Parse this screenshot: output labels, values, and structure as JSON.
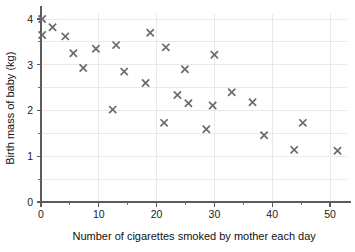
{
  "chart_data": {
    "type": "scatter",
    "title": "",
    "xlabel": "Number of cigarettes smoked by mother each day",
    "ylabel": "Birth mass of baby (kg)",
    "xlim": [
      0,
      53
    ],
    "ylim": [
      0,
      4.1
    ],
    "grid": true,
    "legend": null,
    "marker": "x",
    "marker_color": "#6a6a70",
    "x_ticks": [
      0,
      10,
      20,
      30,
      40,
      50
    ],
    "x_tick_labels": [
      "0",
      "10",
      "20",
      "30",
      "40",
      "50"
    ],
    "x_minor_ticks": [
      5,
      15,
      25,
      35,
      45
    ],
    "y_ticks": [
      0,
      1,
      2,
      3,
      4
    ],
    "y_tick_labels": [
      "0",
      "1",
      "2",
      "3",
      "4"
    ],
    "y_minor_ticks": [
      0.5,
      1.5,
      2.5,
      3.5
    ],
    "points": [
      {
        "x": 0.2,
        "y": 4.0
      },
      {
        "x": 0.2,
        "y": 3.65
      },
      {
        "x": 2.0,
        "y": 3.82
      },
      {
        "x": 4.2,
        "y": 3.62
      },
      {
        "x": 5.6,
        "y": 3.25
      },
      {
        "x": 7.3,
        "y": 2.93
      },
      {
        "x": 9.5,
        "y": 3.35
      },
      {
        "x": 12.4,
        "y": 2.02
      },
      {
        "x": 13.0,
        "y": 3.43
      },
      {
        "x": 14.4,
        "y": 2.85
      },
      {
        "x": 18.1,
        "y": 2.6
      },
      {
        "x": 18.9,
        "y": 3.7
      },
      {
        "x": 21.3,
        "y": 1.73
      },
      {
        "x": 21.6,
        "y": 3.38
      },
      {
        "x": 23.6,
        "y": 2.34
      },
      {
        "x": 24.9,
        "y": 2.9
      },
      {
        "x": 25.5,
        "y": 2.16
      },
      {
        "x": 28.6,
        "y": 1.59
      },
      {
        "x": 29.7,
        "y": 2.11
      },
      {
        "x": 30.0,
        "y": 3.22
      },
      {
        "x": 33.0,
        "y": 2.4
      },
      {
        "x": 36.6,
        "y": 2.18
      },
      {
        "x": 38.6,
        "y": 1.46
      },
      {
        "x": 43.8,
        "y": 1.14
      },
      {
        "x": 45.3,
        "y": 1.73
      },
      {
        "x": 51.3,
        "y": 1.12
      }
    ]
  },
  "figure": {
    "top_cropped_text": "",
    "background_color": "#ffffff",
    "axis_color": "#5b5b5b",
    "grid_color": "#e9e9ed"
  }
}
